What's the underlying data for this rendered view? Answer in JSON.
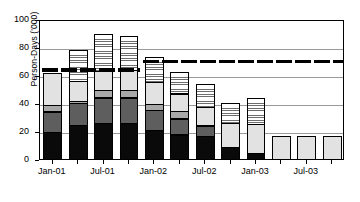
{
  "chart_data": {
    "type": "bar",
    "subtype": "stacked-bar",
    "title": "",
    "xlabel": "",
    "ylabel": "Person-Days ('000)",
    "ylim": [
      0,
      100
    ],
    "yticks": [
      0,
      20,
      40,
      60,
      80,
      100
    ],
    "grid": true,
    "legend": "none",
    "categories": [
      "Jan-01",
      "Apr-01",
      "Jul-01",
      "Oct-01",
      "Jan-02",
      "Apr-02",
      "Jul-02",
      "Oct-02",
      "Jan-03",
      "Apr-03",
      "Jul-03",
      "Oct-03"
    ],
    "tick_labels": [
      "Jan-01",
      "",
      "Jul-01",
      "",
      "Jan-02",
      "",
      "Jul-02",
      "",
      "Jan-03",
      "",
      "Jul-03",
      ""
    ],
    "series": [
      {
        "name": "segment-1-black",
        "values": [
          20,
          25,
          26,
          26,
          21,
          18,
          17,
          9,
          5,
          0,
          0,
          0
        ]
      },
      {
        "name": "segment-2-dark-gray",
        "values": [
          15,
          16,
          19,
          19,
          15,
          12,
          8,
          0,
          0,
          0,
          0,
          0
        ]
      },
      {
        "name": "segment-3-mid-gray",
        "values": [
          5,
          2,
          6,
          6,
          5,
          6,
          0,
          0,
          0,
          0,
          0,
          0
        ]
      },
      {
        "name": "segment-4-light-gray",
        "values": [
          24,
          15,
          14,
          15,
          16,
          13,
          14,
          18,
          21,
          17,
          17,
          17
        ]
      },
      {
        "name": "segment-5-hatched",
        "values": [
          0,
          23,
          27,
          25,
          19,
          16,
          17,
          15,
          19,
          0,
          0,
          0
        ]
      }
    ],
    "totals": [
      64,
      81,
      92,
      91,
      76,
      65,
      56,
      42,
      45,
      17,
      17,
      17
    ],
    "reference_line": {
      "style": "thick-black-dashed",
      "segments": [
        {
          "from_category": "Jan-01",
          "to_category": "Oct-01",
          "value": 65
        },
        {
          "from_category": "Jan-02",
          "to_category": "Oct-03",
          "value": 71
        }
      ]
    }
  },
  "axes": {
    "y_title": "Person-Days ('000)",
    "y_ticks": [
      "0",
      "20",
      "40",
      "60",
      "80",
      "100"
    ],
    "x_ticks": [
      "Jan-01",
      "Jul-01",
      "Jan-02",
      "Jul-02",
      "Jan-03",
      "Jul-03"
    ]
  }
}
